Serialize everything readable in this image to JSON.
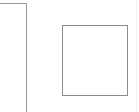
{
  "canvas": {
    "width": 139,
    "height": 112,
    "background_color": "#ffffff",
    "description": "Two plain rectangular outlines on a white background"
  },
  "shapes": [
    {
      "name": "left-rectangle",
      "label": "",
      "role": "outlined rectangle, clipped at left and bottom edges of the view",
      "x": -24,
      "y": 3,
      "width": 51,
      "height": 140,
      "border_color": "#9a9a9a",
      "border_width": 1,
      "fill_color": "#ffffff",
      "visible_edges": "top, right"
    },
    {
      "name": "right-square",
      "label": "",
      "role": "outlined square, fully visible",
      "x": 62,
      "y": 25,
      "width": 66,
      "height": 71,
      "border_color": "#8c8c8c",
      "border_width": 1,
      "fill_color": "#ffffff",
      "visible_edges": "top, right, bottom, left"
    }
  ],
  "artifact": {
    "name": "right-edge-line",
    "color": "#f2f2f2",
    "x": 136,
    "width": 1
  }
}
